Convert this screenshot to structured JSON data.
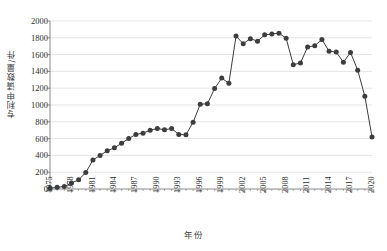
{
  "chart_data": {
    "type": "line",
    "title": "",
    "xlabel": "年份",
    "ylabel": "专利申请数量/件",
    "xlim": [
      1975,
      2020
    ],
    "ylim": [
      0,
      2000
    ],
    "yticks": [
      0,
      200,
      400,
      600,
      800,
      1000,
      1200,
      1400,
      1600,
      1800,
      2000
    ],
    "xticks": [
      1975,
      1978,
      1981,
      1984,
      1987,
      1990,
      1993,
      1996,
      1999,
      2002,
      2005,
      2008,
      2011,
      2014,
      2017,
      2020
    ],
    "grid": "horizontal",
    "legend": "none",
    "marker": "filled-circle",
    "series_color": "#3d3d3d",
    "grid_color": "#d9d9d9",
    "axis_color": "#7a7a7a",
    "x": [
      1975,
      1976,
      1977,
      1978,
      1979,
      1980,
      1981,
      1982,
      1983,
      1984,
      1985,
      1986,
      1987,
      1988,
      1989,
      1990,
      1991,
      1992,
      1993,
      1994,
      1995,
      1996,
      1997,
      1998,
      1999,
      2000,
      2001,
      2002,
      2003,
      2004,
      2005,
      2006,
      2007,
      2008,
      2009,
      2010,
      2011,
      2012,
      2013,
      2014,
      2015,
      2016,
      2017,
      2018,
      2019,
      2020
    ],
    "values": [
      10,
      20,
      30,
      70,
      110,
      195,
      345,
      400,
      455,
      490,
      545,
      600,
      650,
      665,
      700,
      720,
      705,
      720,
      650,
      645,
      795,
      1010,
      1015,
      1195,
      1320,
      1260,
      1820,
      1730,
      1790,
      1760,
      1835,
      1845,
      1855,
      1795,
      1480,
      1500,
      1690,
      1705,
      1780,
      1640,
      1630,
      1510,
      1625,
      1415,
      1105,
      620
    ]
  },
  "bottom_caption": ""
}
